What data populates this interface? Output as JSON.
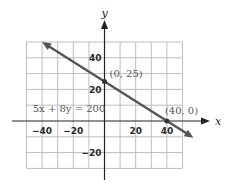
{
  "chart_data": {
    "type": "line",
    "title": "",
    "xlabel": "x",
    "ylabel": "y",
    "xlim": [
      -50,
      50
    ],
    "ylim": [
      -30,
      50
    ],
    "grid": true,
    "grid_step": 10,
    "x_ticks": [
      {
        "value": -40,
        "label": "-40"
      },
      {
        "value": -20,
        "label": "-20"
      },
      {
        "value": 20,
        "label": "20"
      },
      {
        "value": 40,
        "label": "40"
      }
    ],
    "y_ticks": [
      {
        "value": 40,
        "label": "40"
      },
      {
        "value": 20,
        "label": "20"
      },
      {
        "value": -20,
        "label": "-20"
      }
    ],
    "series": [
      {
        "name": "5x + 8y = 200",
        "equation": "5x + 8y = 200",
        "x": [
          -40,
          0,
          40,
          57
        ],
        "y": [
          50,
          25,
          0,
          -10.6
        ],
        "arrows": "both"
      }
    ],
    "points": [
      {
        "x": 0,
        "y": 25,
        "label": "(0, 25)"
      },
      {
        "x": 40,
        "y": 0,
        "label": "(40, 0)"
      }
    ],
    "annotations": [
      {
        "text": "5x + 8y = 200",
        "x": -46,
        "y": 6
      }
    ],
    "colors": {
      "line": "#555555",
      "grid": "#bdbdbd",
      "axis": "#222222"
    }
  }
}
